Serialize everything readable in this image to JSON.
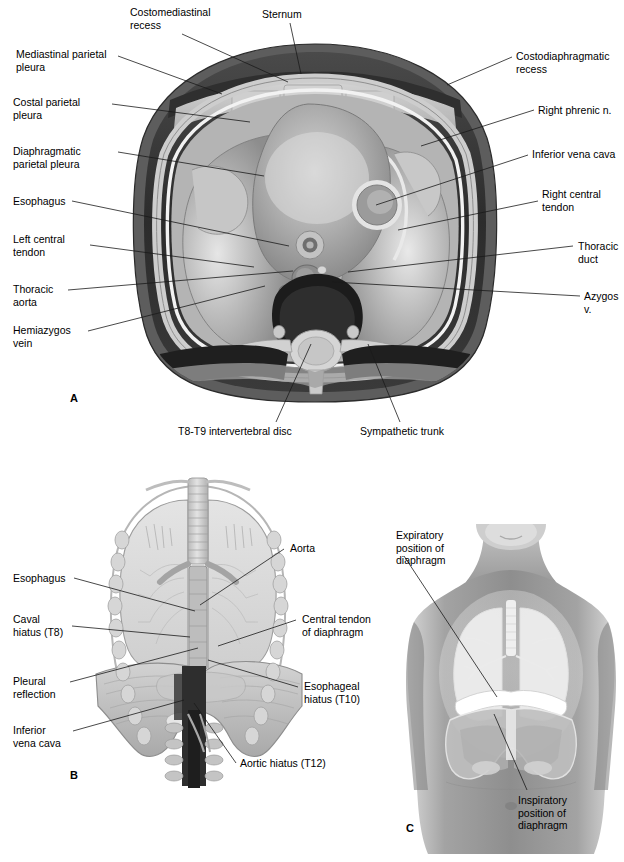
{
  "figure": {
    "panels": [
      {
        "letter": "A",
        "name": "transverse-section-thorax"
      },
      {
        "letter": "B",
        "name": "anterior-view-diaphragm"
      },
      {
        "letter": "C",
        "name": "surface-anatomy-diaphragm"
      }
    ]
  },
  "panelA": {
    "letter": "A",
    "labels": {
      "costomediastinal_recess": "Costomediastinal\nrecess",
      "sternum": "Sternum",
      "costodiaphragmatic_recess": "Costodiaphragmatic\nrecess",
      "mediastinal_parietal_pleura": "Mediastinal parietal\npleura",
      "costal_parietal_pleura": "Costal parietal\npleura",
      "diaphragmatic_parietal_pleura": "Diaphragmatic\nparietal pleura",
      "esophagus": "Esophagus",
      "left_central_tendon": "Left central\ntendon",
      "thoracic_aorta": "Thoracic\naorta",
      "hemiazygos_vein": "Hemiazygos\nvein",
      "right_phrenic_n": "Right phrenic n.",
      "inferior_vena_cava": "Inferior vena cava",
      "right_central_tendon": "Right central\ntendon",
      "thoracic_duct": "Thoracic duct",
      "azygos_v": "Azygos v.",
      "t8_t9_intervertebral_disc": "T8-T9 intervertebral disc",
      "sympathetic_trunk": "Sympathetic trunk"
    }
  },
  "panelB": {
    "letter": "B",
    "labels": {
      "esophagus": "Esophagus",
      "caval_hiatus": "Caval\nhiatus (T8)",
      "pleural_reflection": "Pleural\nreflection",
      "inferior_vena_cava": "Inferior\nvena cava",
      "aorta": "Aorta",
      "central_tendon_of_diaphragm": "Central tendon\nof diaphragm",
      "esophageal_hiatus": "Esophageal\nhiatus (T10)",
      "aortic_hiatus": "Aortic hiatus (T12)"
    }
  },
  "panelC": {
    "letter": "C",
    "labels": {
      "expiratory_position": "Expiratory\nposition of\ndiaphragm",
      "inspiratory_position": "Inspiratory\nposition of\ndiaphragm"
    }
  },
  "colors": {
    "background": "#ffffff",
    "ink": "#000000",
    "leader": "#1a1a1a",
    "skin_outer": "#6f6f6f",
    "muscle_dark": "#2a2a2a",
    "bone_light": "#d9d9d9",
    "lung_mid": "#9a9a9a",
    "lung_light": "#c8c8c8",
    "pleura_line": "#efefef",
    "vessel_dark": "#4a4a4a",
    "panelC_body": "#9e9e9e",
    "panelC_lung": "#e8e8e8"
  }
}
